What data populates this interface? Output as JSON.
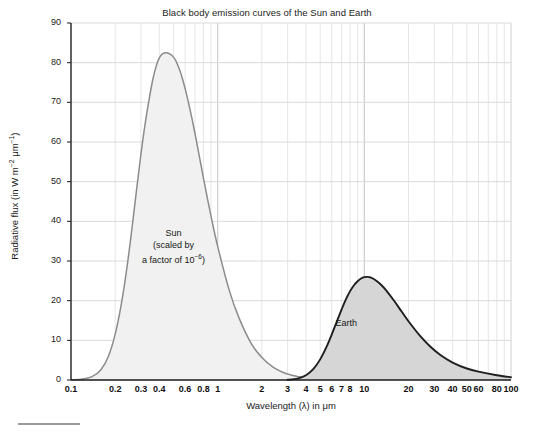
{
  "chart_data": {
    "type": "line",
    "title": "Black body emission curves of the Sun and Earth",
    "xlabel": "Wavelength (λ) in μm",
    "ylabel": "Radiative flux (in W m⁻² μm⁻¹)",
    "xscale": "log",
    "yscale": "linear",
    "xlim": [
      0.1,
      100
    ],
    "ylim": [
      0,
      90
    ],
    "grid": true,
    "legend_position": "inline-annotations",
    "xticks": [
      0.1,
      0.2,
      0.3,
      0.4,
      0.6,
      0.8,
      1,
      2,
      3,
      4,
      5,
      6,
      7,
      8,
      10,
      20,
      30,
      40,
      50,
      60,
      80,
      100
    ],
    "xticklabels": [
      "0.1",
      "0.2",
      "0.3",
      "0.4",
      "0.6",
      "0.8",
      "1",
      "2",
      "3",
      "4",
      "5",
      "6",
      "7",
      "8",
      "10",
      "20",
      "30",
      "40",
      "50",
      "60",
      "80",
      "100"
    ],
    "yticks": [
      0,
      10,
      20,
      30,
      40,
      50,
      60,
      70,
      80,
      90
    ],
    "yticklabels": [
      "0",
      "10",
      "20",
      "30",
      "40",
      "50",
      "60",
      "70",
      "80",
      "90"
    ],
    "series": [
      {
        "name": "Sun",
        "annotation_lines": [
          "Sun",
          "(scaled by",
          "a factor of 10⁻⁶)"
        ],
        "stroke": "#8c8c8c",
        "fill": "#f1f1f1",
        "peak_x": 0.5,
        "peak_y": 82.5,
        "x": [
          0.1,
          0.12,
          0.14,
          0.16,
          0.18,
          0.2,
          0.22,
          0.24,
          0.26,
          0.28,
          0.3,
          0.32,
          0.34,
          0.36,
          0.38,
          0.4,
          0.42,
          0.45,
          0.48,
          0.5,
          0.52,
          0.55,
          0.58,
          0.62,
          0.66,
          0.7,
          0.75,
          0.8,
          0.9,
          1.0,
          1.2,
          1.4,
          1.7,
          2.0,
          2.4,
          2.8,
          3.2,
          3.6,
          4.0
        ],
        "y": [
          0.05,
          0.25,
          0.9,
          2.6,
          6.0,
          11.5,
          19.0,
          28.0,
          38.0,
          48.0,
          57.0,
          64.5,
          70.5,
          75.5,
          79.0,
          81.2,
          82.2,
          82.5,
          82.0,
          81.4,
          80.4,
          78.2,
          75.5,
          71.3,
          66.8,
          62.2,
          56.4,
          50.9,
          41.4,
          33.7,
          22.6,
          15.6,
          9.1,
          5.7,
          3.2,
          1.9,
          1.2,
          0.8,
          0.5
        ]
      },
      {
        "name": "Earth",
        "annotation_lines": [
          "Earth"
        ],
        "stroke": "#1f1f1f",
        "fill": "#d6d6d6",
        "peak_x": 10.0,
        "peak_y": 26.0,
        "x": [
          3.0,
          3.5,
          4.0,
          4.5,
          5.0,
          5.5,
          6.0,
          6.5,
          7.0,
          7.5,
          8.0,
          8.5,
          9.0,
          9.5,
          10.0,
          10.5,
          11.0,
          12.0,
          13.0,
          14.0,
          16.0,
          18.0,
          20.0,
          24.0,
          28.0,
          33.0,
          40.0,
          50.0,
          60.0,
          80.0,
          100.0
        ],
        "y": [
          0.05,
          0.35,
          1.2,
          2.8,
          5.2,
          8.2,
          11.5,
          14.8,
          17.8,
          20.4,
          22.4,
          23.9,
          24.9,
          25.6,
          25.95,
          26.0,
          25.85,
          25.1,
          24.0,
          22.7,
          19.9,
          17.2,
          14.8,
          11.1,
          8.5,
          6.3,
          4.4,
          2.9,
          2.1,
          1.2,
          0.7
        ]
      }
    ]
  },
  "figure": {
    "bottom_bar_name": "progress-bar"
  }
}
